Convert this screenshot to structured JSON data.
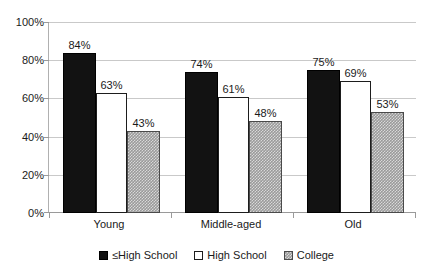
{
  "chart_data": {
    "type": "bar",
    "title": "",
    "xlabel": "",
    "ylabel": "",
    "categories": [
      "Young",
      "Middle-aged",
      "Old"
    ],
    "series": [
      {
        "name": "≤High School",
        "key": "low",
        "color": "#121212",
        "values": [
          84,
          63,
          75
        ]
      },
      {
        "name": "High School",
        "key": "hs",
        "color": "#ffffff",
        "values": [
          63,
          61,
          69
        ]
      },
      {
        "name": "College",
        "key": "col",
        "color": "#9a9a9a",
        "values": [
          43,
          48,
          53
        ]
      }
    ],
    "value_labels": [
      [
        "84%",
        "63%",
        "43%"
      ],
      [
        "74%",
        "61%",
        "48%"
      ],
      [
        "75%",
        "69%",
        "53%"
      ]
    ],
    "series_values_by_group": [
      [
        84,
        63,
        43
      ],
      [
        74,
        61,
        48
      ],
      [
        75,
        69,
        53
      ]
    ],
    "ylim": [
      0,
      100
    ],
    "ytick_values": [
      100,
      80,
      60,
      40,
      20,
      0
    ],
    "ytick_labels": [
      "100%",
      "80%",
      "60%",
      "40%",
      "20%",
      "0%"
    ],
    "grid": true,
    "legend_position": "bottom"
  },
  "axis": {
    "y_labels": [
      "100%",
      "80%",
      "60%",
      "40%",
      "20%",
      "0%"
    ],
    "x_labels": [
      "Young",
      "Middle-aged",
      "Old"
    ]
  },
  "legend": {
    "items": [
      {
        "label": "≤High School",
        "style": "s-low"
      },
      {
        "label": "High School",
        "style": "s-hs"
      },
      {
        "label": "College",
        "style": "s-col"
      }
    ]
  },
  "values": {
    "g0": {
      "low": "84%",
      "hs": "63%",
      "col": "43%"
    },
    "g1": {
      "low": "74%",
      "hs": "61%",
      "col": "48%"
    },
    "g2": {
      "low": "75%",
      "hs": "69%",
      "col": "53%"
    }
  }
}
